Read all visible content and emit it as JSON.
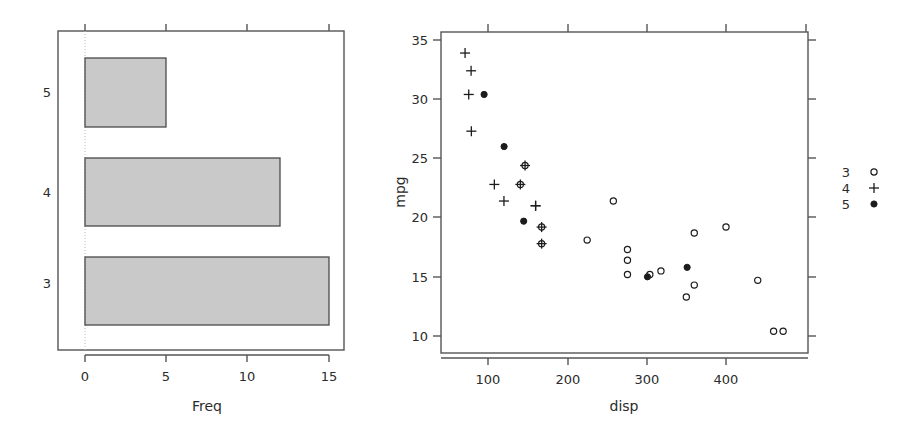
{
  "figure": {
    "width": 921,
    "height": 428,
    "background": "#ffffff",
    "line_color": "#555555",
    "bar_fill": "#c9c9c9",
    "bar_border": "#4a4a4a",
    "point_color": "#1c1c1c"
  },
  "chart_data": [
    {
      "type": "bar",
      "orientation": "horizontal",
      "title": "",
      "xlabel": "Freq",
      "ylabel": "",
      "categories": [
        "3",
        "4",
        "5"
      ],
      "values": [
        15,
        12,
        5
      ],
      "xlim": [
        0,
        16
      ],
      "xticks": [
        0,
        5,
        10,
        15
      ],
      "xtick_labels": [
        "0",
        "5",
        "10",
        "15"
      ],
      "grid": false,
      "legend": "none",
      "zero_reference_line": 0
    },
    {
      "type": "scatter",
      "title": "",
      "xlabel": "disp",
      "ylabel": "mpg",
      "xlim": [
        50,
        480
      ],
      "ylim": [
        9.5,
        35.5
      ],
      "xticks": [
        100,
        200,
        300,
        400
      ],
      "xtick_labels": [
        "100",
        "200",
        "300",
        "400"
      ],
      "yticks": [
        10,
        15,
        20,
        25,
        30,
        35
      ],
      "ytick_labels": [
        "10",
        "15",
        "20",
        "25",
        "30",
        "35"
      ],
      "grid": false,
      "legend_position": "right-outside",
      "legend_title": "",
      "series": [
        {
          "name": "3",
          "marker": "open-circle",
          "x": [
            258,
            360,
            225,
            360,
            146.7,
            140.8,
            167.6,
            167.6,
            275.8,
            275.8,
            275.8,
            472,
            460,
            440,
            318,
            304,
            350,
            400
          ],
          "y": [
            21.4,
            18.7,
            18.1,
            14.3,
            24.4,
            22.8,
            19.2,
            17.8,
            16.4,
            17.3,
            15.2,
            10.4,
            10.4,
            14.7,
            15.5,
            15.2,
            13.3,
            19.2
          ]
        },
        {
          "name": "4",
          "marker": "plus",
          "x": [
            160,
            160,
            108,
            146.7,
            140.8,
            167.6,
            167.6,
            78.7,
            75.7,
            71.1,
            120.1,
            79
          ],
          "y": [
            21.0,
            21.0,
            22.8,
            24.4,
            22.8,
            19.2,
            17.8,
            32.4,
            30.4,
            33.9,
            21.4,
            27.3
          ]
        },
        {
          "name": "5",
          "marker": "filled-circle",
          "x": [
            120.3,
            95.1,
            351,
            145,
            301
          ],
          "y": [
            26.0,
            30.4,
            15.8,
            19.7,
            15.0
          ]
        }
      ],
      "legend_entries": [
        {
          "label": "3",
          "marker": "open-circle"
        },
        {
          "label": "4",
          "marker": "plus"
        },
        {
          "label": "5",
          "marker": "filled-circle"
        }
      ]
    }
  ],
  "bar_panel": {
    "axis_title": "Freq",
    "category_labels": [
      "5",
      "4",
      "3"
    ],
    "tick_labels": [
      "0",
      "5",
      "10",
      "15"
    ]
  },
  "scatter_panel": {
    "x_axis_title": "disp",
    "y_axis_title": "mpg",
    "x_tick_labels": [
      "100",
      "200",
      "300",
      "400"
    ],
    "y_tick_labels": [
      "35",
      "30",
      "25",
      "20",
      "15",
      "10"
    ]
  },
  "legend": {
    "rows": [
      "3",
      "4",
      "5"
    ]
  }
}
